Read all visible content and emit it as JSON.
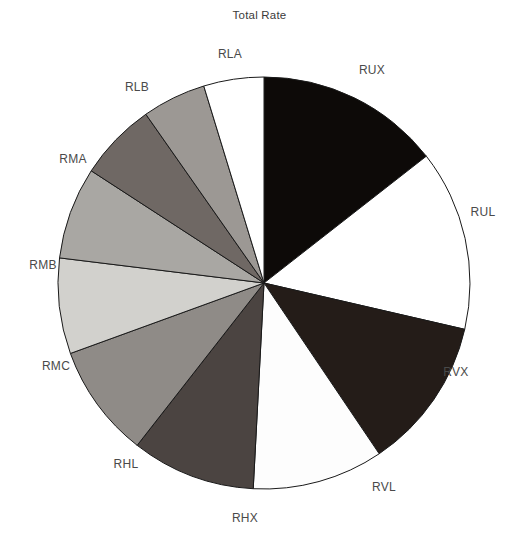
{
  "chart": {
    "title": "Total Rate"
  },
  "chart_data": {
    "type": "pie",
    "title": "Total Rate",
    "xlabel": "",
    "ylabel": "",
    "legend_position": "none",
    "grid": false,
    "start_angle_deg": 0,
    "direction": "clockwise",
    "center_px": [
      264,
      283
    ],
    "radius_px": 206,
    "categories": [
      "RUX",
      "RUL",
      "RVX",
      "RVL",
      "RHX",
      "RHL",
      "RMC",
      "RMB",
      "RMA",
      "RLB",
      "RLA"
    ],
    "values": [
      14.4,
      14.2,
      11.9,
      10.3,
      9.7,
      8.9,
      7.5,
      7.2,
      6.1,
      5.0,
      4.8
    ],
    "angles_deg": [
      52,
      51,
      43,
      37,
      35,
      32,
      27,
      26,
      22,
      18,
      17
    ],
    "colors": [
      "#0d0a08",
      "#ffffff",
      "#241c18",
      "#fdfdfd",
      "#4b4441",
      "#8f8b87",
      "#d2d1cd",
      "#a9a7a3",
      "#6f6864",
      "#9c9894",
      "#ffffff"
    ],
    "slices": [
      {
        "label": "RUX",
        "value": 14.4,
        "angle_deg": 52,
        "color": "#0d0a08",
        "label_x": 372,
        "label_y": 70
      },
      {
        "label": "RUL",
        "value": 14.2,
        "angle_deg": 51,
        "color": "#ffffff",
        "label_x": 483,
        "label_y": 212
      },
      {
        "label": "RVX",
        "value": 11.9,
        "angle_deg": 43,
        "color": "#241c18",
        "label_x": 456,
        "label_y": 372
      },
      {
        "label": "RVL",
        "value": 10.3,
        "angle_deg": 37,
        "color": "#fdfdfd",
        "label_x": 384,
        "label_y": 487
      },
      {
        "label": "RHX",
        "value": 9.7,
        "angle_deg": 35,
        "color": "#4b4441",
        "label_x": 245,
        "label_y": 518
      },
      {
        "label": "RHL",
        "value": 8.9,
        "angle_deg": 32,
        "color": "#8f8b87",
        "label_x": 126,
        "label_y": 464
      },
      {
        "label": "RMC",
        "value": 7.5,
        "angle_deg": 27,
        "color": "#d2d1cd",
        "label_x": 56,
        "label_y": 366
      },
      {
        "label": "RMB",
        "value": 7.2,
        "angle_deg": 26,
        "color": "#a9a7a3",
        "label_x": 43,
        "label_y": 265
      },
      {
        "label": "RMA",
        "value": 6.1,
        "angle_deg": 22,
        "color": "#6f6864",
        "label_x": 73,
        "label_y": 159
      },
      {
        "label": "RLB",
        "value": 5.0,
        "angle_deg": 18,
        "color": "#9c9894",
        "label_x": 137,
        "label_y": 87
      },
      {
        "label": "RLA",
        "value": 4.8,
        "angle_deg": 17,
        "color": "#ffffff",
        "label_x": 230,
        "label_y": 54
      }
    ]
  }
}
